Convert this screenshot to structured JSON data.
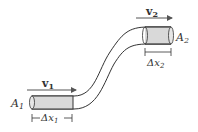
{
  "diagram": {
    "labels": {
      "v1": "v",
      "v1_sub": "1",
      "v2": "v",
      "v2_sub": "2",
      "A1": "A",
      "A1_sub": "1",
      "A2": "A",
      "A2_sub": "2",
      "dx1": "Δx",
      "dx1_sub": "1",
      "dx2": "Δx",
      "dx2_sub": "2"
    },
    "colors": {
      "pipe_stroke": "#333333",
      "segment_fill": "#d9d9d9",
      "arrow": "#555555",
      "background": "#ffffff"
    }
  }
}
